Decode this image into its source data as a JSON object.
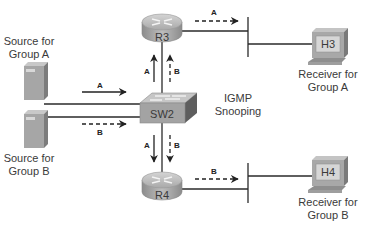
{
  "diagram": {
    "devices": {
      "r3": {
        "label": "R3",
        "type": "router"
      },
      "r4": {
        "label": "R4",
        "type": "router"
      },
      "sw2": {
        "label": "SW2",
        "type": "switch",
        "note_line1": "IGMP",
        "note_line2": "Snooping"
      },
      "h3": {
        "label": "H3",
        "type": "host",
        "caption_line1": "Receiver for",
        "caption_line2": "Group A"
      },
      "h4": {
        "label": "H4",
        "type": "host",
        "caption_line1": "Receiver for",
        "caption_line2": "Group B"
      },
      "source_a": {
        "type": "server",
        "caption_line1": "Source for",
        "caption_line2": "Group A"
      },
      "source_b": {
        "type": "server",
        "caption_line1": "Source for",
        "caption_line2": "Group B"
      }
    },
    "flows": {
      "src_a_to_sw2": {
        "label": "A",
        "style": "solid"
      },
      "src_b_to_sw2": {
        "label": "B",
        "style": "dashed"
      },
      "sw2_to_r3_a": {
        "label": "A",
        "style": "solid"
      },
      "sw2_to_r3_b": {
        "label": "B",
        "style": "dashed"
      },
      "sw2_to_r4_a": {
        "label": "A",
        "style": "solid"
      },
      "sw2_to_r4_b": {
        "label": "B",
        "style": "dashed"
      },
      "r3_to_lan_a": {
        "label": "A",
        "style": "dashed"
      },
      "r4_to_lan_b": {
        "label": "B",
        "style": "dashed"
      }
    },
    "colors": {
      "line": "#2a2a2a",
      "device_fill": "#a8a8a8",
      "device_dark": "#7a7a7a",
      "screen": "#c9c9c9"
    }
  }
}
